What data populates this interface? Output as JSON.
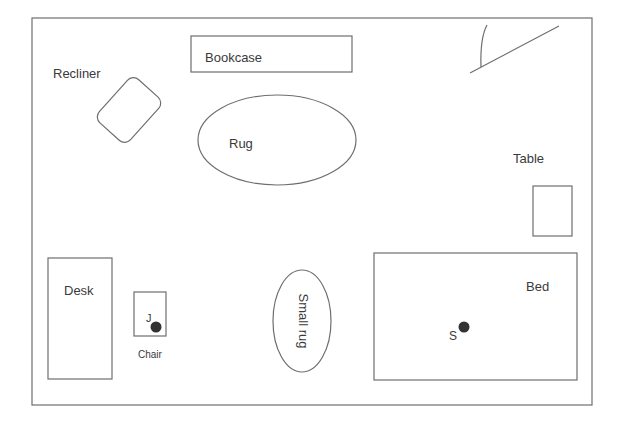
{
  "diagram": {
    "type": "floor-plan",
    "room": {
      "x": 32,
      "y": 18,
      "width": 560,
      "height": 387
    },
    "colors": {
      "stroke": "#6e6e6e",
      "text": "#3a3a3a",
      "marker": "#333333",
      "background": "#ffffff"
    },
    "door": {
      "label": "",
      "line": {
        "x1": 470,
        "y1": 73,
        "x2": 559,
        "y2": 26
      },
      "swing": {
        "x1": 481,
        "y1": 67,
        "x2": 487,
        "y2": 25
      }
    },
    "furniture": {
      "bookcase": {
        "label": "Bookcase",
        "x": 191,
        "y": 36,
        "width": 161,
        "height": 36
      },
      "recliner": {
        "label": "Recliner",
        "cx": 129,
        "cy": 110,
        "width": 42,
        "height": 58,
        "rotation": 42
      },
      "rug": {
        "label": "Rug",
        "cx": 277,
        "cy": 140,
        "rx": 79,
        "ry": 45
      },
      "table": {
        "label": "Table",
        "x": 533,
        "y": 186,
        "width": 39,
        "height": 50
      },
      "desk": {
        "label": "Desk",
        "x": 48,
        "y": 258,
        "width": 64,
        "height": 121
      },
      "chair": {
        "label": "Chair",
        "x": 134,
        "y": 292,
        "width": 32,
        "height": 44
      },
      "small_rug": {
        "label": "Small rug",
        "cx": 302,
        "cy": 321,
        "rx": 29,
        "ry": 51
      },
      "bed": {
        "label": "Bed",
        "x": 374,
        "y": 253,
        "width": 203,
        "height": 127
      }
    },
    "markers": [
      {
        "label": "J",
        "cx": 156,
        "cy": 327,
        "r": 5.5
      },
      {
        "label": "S",
        "cx": 464,
        "cy": 327,
        "r": 5.5
      }
    ]
  }
}
